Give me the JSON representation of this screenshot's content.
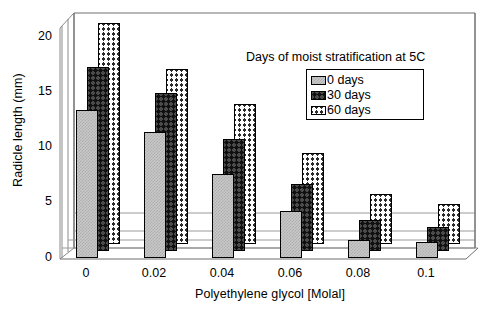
{
  "chart_data": {
    "type": "bar",
    "title": "",
    "xlabel": "Polyethylene glycol [Molal]",
    "ylabel": "Radicle length (mm)",
    "categories": [
      "0",
      "0.02",
      "0.04",
      "0.06",
      "0.08",
      "0.1"
    ],
    "yticks": [
      "0",
      "5",
      "10",
      "15",
      "20"
    ],
    "ylim": [
      0,
      20
    ],
    "grid": true,
    "legend_position": "top-right",
    "legend_title": "Days of moist stratification at 5C",
    "series": [
      {
        "name": "0 days",
        "values": [
          12.3,
          10.5,
          7.0,
          3.9,
          1.5,
          1.3
        ]
      },
      {
        "name": "30 days",
        "values": [
          15.3,
          13.2,
          9.3,
          5.6,
          2.6,
          2.0
        ]
      },
      {
        "name": "60 days",
        "values": [
          18.4,
          14.6,
          11.7,
          7.6,
          4.2,
          3.3
        ]
      }
    ]
  },
  "legend": {
    "title": "Days of moist stratification at 5C",
    "items": [
      {
        "label": "0 days"
      },
      {
        "label": "30 days"
      },
      {
        "label": "60 days"
      }
    ]
  },
  "axes": {
    "x_title": "Polyethylene glycol [Molal]",
    "y_title": "Radicle length (mm)",
    "x_ticks": [
      "0",
      "0.02",
      "0.04",
      "0.06",
      "0.08",
      "0.1"
    ],
    "y_ticks": [
      "20",
      "15",
      "10",
      "5",
      "0"
    ]
  },
  "colors": {
    "series_0": "#c9c9c9",
    "series_1": "#101010",
    "series_2": "#ffffff",
    "axis": "#000000",
    "grid": "#9a9a9a"
  }
}
